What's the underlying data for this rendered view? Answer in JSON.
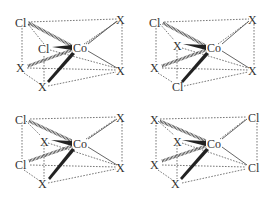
{
  "diagram": {
    "center_atom": "Co",
    "ligand_labels": [
      "Cl",
      "X"
    ],
    "isomers": [
      {
        "position": "top-left",
        "offset": [
          0,
          0
        ],
        "center": "Co",
        "ligands": {
          "back_left": "Cl",
          "front_left_mid": "Cl",
          "front_left_low": "X",
          "bottom": "X",
          "back_right": "X",
          "front_right": "X"
        }
      },
      {
        "position": "top-right",
        "offset": [
          136,
          0
        ],
        "center": "Co",
        "ligands": {
          "back_left": "Cl",
          "front_left_mid": "X",
          "front_left_low": "X",
          "bottom": "Cl",
          "back_right": "X",
          "front_right": "X"
        }
      },
      {
        "position": "bottom-left",
        "offset": [
          0,
          99
        ],
        "center": "Co",
        "ligands": {
          "back_left": "Cl",
          "front_left_mid": "X",
          "front_left_low": "Cl",
          "bottom": "X",
          "back_right": "X",
          "front_right": "X"
        }
      },
      {
        "position": "bottom-right",
        "offset": [
          136,
          99
        ],
        "center": "Co",
        "ligands": {
          "back_left": "X",
          "front_left_mid": "X",
          "front_left_low": "X",
          "bottom": "X",
          "back_right": "Cl",
          "front_right": "Cl"
        }
      }
    ]
  }
}
